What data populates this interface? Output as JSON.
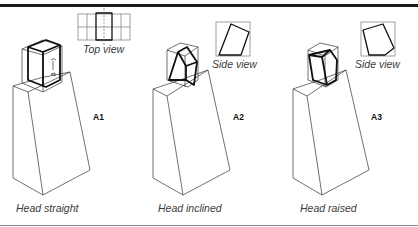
{
  "figure": {
    "panels": [
      {
        "id": "A1",
        "code": "A1",
        "caption": "Head straight",
        "inset_label": "Top view"
      },
      {
        "id": "A2",
        "code": "A2",
        "caption": "Head inclined",
        "inset_label": "Side view"
      },
      {
        "id": "A3",
        "code": "A3",
        "caption": "Head raised",
        "inset_label": "Side view"
      }
    ]
  }
}
